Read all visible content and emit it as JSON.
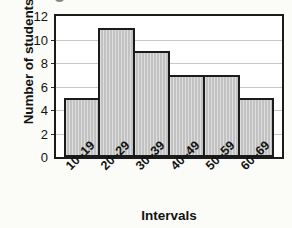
{
  "chart_data": {
    "type": "bar",
    "title": "",
    "subtitle": "",
    "xlabel": "Intervals",
    "ylabel": "Number of students",
    "categories": [
      "10–19",
      "20–29",
      "30–39",
      "40–49",
      "50–59",
      "60–69"
    ],
    "values": [
      5,
      11,
      9,
      7,
      7,
      5
    ],
    "ylim": [
      0,
      12
    ],
    "ytick_values": [
      0,
      2,
      4,
      6,
      8,
      10,
      12
    ],
    "ytick_labels": [
      "0",
      "2",
      "4",
      "6",
      "8",
      "10",
      "12"
    ],
    "grid": "horizontal",
    "legend": "none",
    "series": [
      {
        "name": "Number of students",
        "values": [
          5,
          11,
          9,
          7,
          7,
          5
        ]
      }
    ],
    "bar_style": {
      "fill_color": "#c2c2c2",
      "edge_color": "#1b1b1b",
      "hatch": "vertical-lines",
      "contiguous": true
    },
    "colors": {
      "background": "#fbfbf7",
      "plot_background": "#ffffff",
      "axis": "#1b1b1b",
      "gridline": "#c9c9c9",
      "text": "#131313"
    }
  }
}
